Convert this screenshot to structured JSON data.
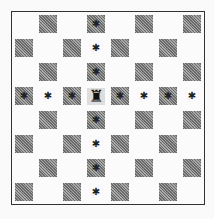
{
  "diagram": {
    "board_size": 8,
    "first_square_color": "light",
    "colors": {
      "light": "#fbfbfb",
      "dark": "#8a8a8a",
      "border": "#333333",
      "mark": "#222222"
    },
    "piece": {
      "type": "rook",
      "glyph": "♜",
      "row": 3,
      "col": 3,
      "square": "d5"
    },
    "marker_glyph": "✱",
    "marked_squares": [
      {
        "row": 0,
        "col": 3
      },
      {
        "row": 1,
        "col": 3
      },
      {
        "row": 2,
        "col": 3
      },
      {
        "row": 4,
        "col": 3
      },
      {
        "row": 5,
        "col": 3
      },
      {
        "row": 6,
        "col": 3
      },
      {
        "row": 7,
        "col": 3
      },
      {
        "row": 3,
        "col": 0
      },
      {
        "row": 3,
        "col": 1
      },
      {
        "row": 3,
        "col": 2
      },
      {
        "row": 3,
        "col": 4
      },
      {
        "row": 3,
        "col": 5
      },
      {
        "row": 3,
        "col": 6
      },
      {
        "row": 3,
        "col": 7
      }
    ]
  }
}
